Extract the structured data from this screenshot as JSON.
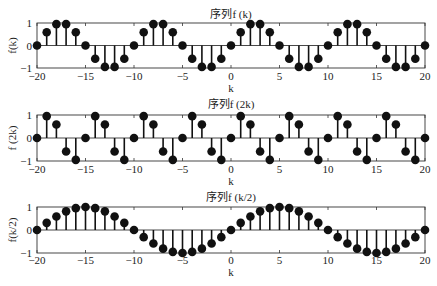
{
  "chart_data": [
    {
      "type": "stem",
      "title": "序列f (k)",
      "xlabel": "k",
      "ylabel": "f(k)",
      "xlim": [
        -20,
        20
      ],
      "ylim": [
        -1,
        1
      ],
      "xticks": [
        -20,
        -15,
        -10,
        -5,
        0,
        5,
        10,
        15,
        20
      ],
      "yticks": [
        -1,
        0,
        1
      ],
      "grid": false,
      "x": [
        -20,
        -19,
        -18,
        -17,
        -16,
        -15,
        -14,
        -13,
        -12,
        -11,
        -10,
        -9,
        -8,
        -7,
        -6,
        -5,
        -4,
        -3,
        -2,
        -1,
        0,
        1,
        2,
        3,
        4,
        5,
        6,
        7,
        8,
        9,
        10,
        11,
        12,
        13,
        14,
        15,
        16,
        17,
        18,
        19,
        20
      ],
      "values": [
        0,
        0.59,
        0.95,
        0.95,
        0.59,
        0,
        -0.59,
        -0.95,
        -0.95,
        -0.59,
        0,
        0.59,
        0.95,
        0.95,
        0.59,
        0,
        -0.59,
        -0.95,
        -0.95,
        -0.59,
        0,
        0.59,
        0.95,
        0.95,
        0.59,
        0,
        -0.59,
        -0.95,
        -0.95,
        -0.59,
        0,
        0.59,
        0.95,
        0.95,
        0.59,
        0,
        -0.59,
        -0.95,
        -0.95,
        -0.59,
        0
      ]
    },
    {
      "type": "stem",
      "title": "序列f (2k)",
      "xlabel": "k",
      "ylabel": "f (2k)",
      "xlim": [
        -20,
        20
      ],
      "ylim": [
        -1,
        1
      ],
      "xticks": [
        -20,
        -15,
        -10,
        -5,
        0,
        5,
        10,
        15,
        20
      ],
      "yticks": [
        -1,
        0,
        1
      ],
      "grid": false,
      "x": [
        -20,
        -19,
        -18,
        -17,
        -16,
        -15,
        -14,
        -13,
        -12,
        -11,
        -10,
        -9,
        -8,
        -7,
        -6,
        -5,
        -4,
        -3,
        -2,
        -1,
        0,
        1,
        2,
        3,
        4,
        5,
        6,
        7,
        8,
        9,
        10,
        11,
        12,
        13,
        14,
        15,
        16,
        17,
        18,
        19,
        20
      ],
      "values": [
        0,
        0.95,
        0.59,
        -0.59,
        -0.95,
        0,
        0.95,
        0.59,
        -0.59,
        -0.95,
        0,
        0.95,
        0.59,
        -0.59,
        -0.95,
        0,
        0.95,
        0.59,
        -0.59,
        -0.95,
        0,
        0.95,
        0.59,
        -0.59,
        -0.95,
        0,
        0.95,
        0.59,
        -0.59,
        -0.95,
        0,
        0.95,
        0.59,
        -0.59,
        -0.95,
        0,
        0.95,
        0.59,
        -0.59,
        -0.95,
        0
      ]
    },
    {
      "type": "stem",
      "title": "序列f (k/2)",
      "xlabel": "k",
      "ylabel": "f(k/2)",
      "xlim": [
        -20,
        20
      ],
      "ylim": [
        -1,
        1
      ],
      "xticks": [
        -20,
        -15,
        -10,
        -5,
        0,
        5,
        10,
        15,
        20
      ],
      "yticks": [
        -1,
        0,
        1
      ],
      "grid": false,
      "x": [
        -20,
        -19,
        -18,
        -17,
        -16,
        -15,
        -14,
        -13,
        -12,
        -11,
        -10,
        -9,
        -8,
        -7,
        -6,
        -5,
        -4,
        -3,
        -2,
        -1,
        0,
        1,
        2,
        3,
        4,
        5,
        6,
        7,
        8,
        9,
        10,
        11,
        12,
        13,
        14,
        15,
        16,
        17,
        18,
        19,
        20
      ],
      "values": [
        0,
        0.31,
        0.59,
        0.81,
        0.95,
        1,
        0.95,
        0.81,
        0.59,
        0.31,
        0,
        -0.31,
        -0.59,
        -0.81,
        -0.95,
        -1,
        -0.95,
        -0.81,
        -0.59,
        -0.31,
        0,
        0.31,
        0.59,
        0.81,
        0.95,
        1,
        0.95,
        0.81,
        0.59,
        0.31,
        0,
        -0.31,
        -0.59,
        -0.81,
        -0.95,
        -1,
        -0.95,
        -0.81,
        -0.59,
        -0.31,
        0
      ]
    }
  ],
  "layout": {
    "panels": [
      {
        "top": 23,
        "bottom": 68,
        "title_y": 18,
        "ticklabel_y": 80,
        "xlabel_y": 92
      },
      {
        "top": 115,
        "bottom": 161,
        "title_y": 108,
        "ticklabel_y": 173,
        "xlabel_y": 185
      },
      {
        "top": 207,
        "bottom": 253,
        "title_y": 201,
        "ticklabel_y": 264,
        "xlabel_y": 276
      }
    ],
    "left": 37,
    "right": 425
  }
}
